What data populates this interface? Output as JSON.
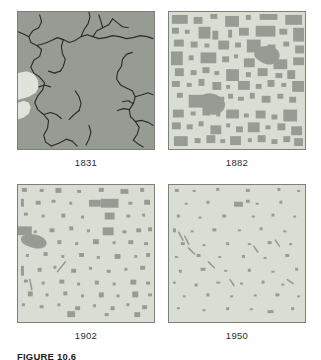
{
  "figure": {
    "caption": "FIGURE 10.6",
    "colors": {
      "forest": "#969b93",
      "cleared": "#d9ddd4",
      "prairie": "#dfe3da",
      "stream": "#2b2b2b",
      "frame_border": "#7d8279",
      "page_background": "#ffffff",
      "label_text": "#2b2b2b"
    }
  },
  "panels": [
    {
      "year": "1831",
      "position": "top-left",
      "background_class": "forest",
      "has_streams": true,
      "has_prairie": true,
      "forest_shapes": [],
      "prairie_shapes": [
        "M0,62 L9,60 L16,63 L20,69 L21,76 L18,82 L11,86 L4,88 L0,89 Z",
        "M0,92 L6,90 L11,92 L13,97 L11,103 L6,107 L0,109 Z"
      ],
      "streams": [
        "M22,3 L24,10 L21,16 L15,19 L11,25 L13,31 L19,34 L24,38 L22,45 L16,49 L13,56 L16,62 L22,66 L27,72 L25,79 L20,85 L17,92 L20,99 L26,104 L31,110 L30,118 L26,125 L28,132 L34,136",
        "M34,136 L42,133 L49,129 L55,131 L60,136",
        "M19,34 L27,32 L34,29 L40,26 L46,28 L52,31 L58,29 L64,25 L70,23 L76,25 L82,27 L89,26",
        "M89,26 L96,24 L103,25 L110,27 L117,26 L124,24 L131,25 L137,27",
        "M64,25 L67,18 L71,12 L73,5 L72,0",
        "M76,25 L80,19 L86,16 L92,13 L96,7",
        "M96,7 L101,11 L106,15 L112,16",
        "M86,16 L84,9 L82,3",
        "M46,28 L44,35 L45,42 L48,48 L46,55 L43,60",
        "M43,60 L37,62 L31,60",
        "M11,25 L5,22 L0,20",
        "M21,76 L27,74 L33,76",
        "M26,104 L33,102 L39,104 L44,108",
        "M105,55 L101,61 L100,68 L104,74 L110,77 L116,80 L119,86 L117,93 L113,99 L114,106 L119,111 L123,117 L121,124 L117,130",
        "M105,55 L106,48 L110,43 L116,41",
        "M119,86 L126,84 L132,82 L137,84",
        "M119,111 L126,110 L132,112 L137,115",
        "M113,99 L107,98 L101,100",
        "M117,130 L122,134 L127,137",
        "M117,93 L112,90 L106,91",
        "M58,80 L62,86 L64,93 L62,100",
        "M62,100 L57,104 L52,109",
        "M72,115 L74,122 L72,129 L69,135"
      ]
    },
    {
      "year": "1882",
      "position": "top-right",
      "background_class": "cleared",
      "has_streams": false,
      "has_prairie": false,
      "forest_shapes": [
        "M3,3 h16 v9 h-16 z",
        "M25,5 h9 v7 h-9 z",
        "M42,2 h7 v5 h-7 z",
        "M57,4 h14 v11 h-14 z",
        "M78,3 h5 v5 h-5 z",
        "M92,2 h18 v6 h-18 z",
        "M118,3 h17 v10 h-17 z",
        "M3,16 h7 v6 h-7 z",
        "M16,18 h5 v4 h-5 z",
        "M30,15 h12 v12 h-12 z",
        "M44,19 h6 v9 h-6 z",
        "M60,18 h4 v8 h-4 z",
        "M71,16 h10 v8 h-10 z",
        "M88,14 h20 v11 h-20 z",
        "M112,17 h8 v6 h-8 z",
        "M126,16 h11 v14 h-11 z",
        "M5,28 h10 v7 h-10 z",
        "M22,30 h7 v6 h-7 z",
        "M36,32 h5 v4 h-5 z",
        "M50,29 h11 v9 h-11 z",
        "M67,31 h6 v5 h-6 z",
        "M79,28 h14 v13 h-14 z",
        "M100,33 h8 v6 h-8 z",
        "M116,30 h6 v5 h-6 z",
        "M128,34 h9 v8 h-9 z",
        "M2,40 h12 v14 h-12 z",
        "M20,44 h5 v5 h-5 z",
        "M32,41 h16 v11 h-16 z",
        "M54,45 h7 v6 h-7 z",
        "M66,43 h4 v4 h-4 z",
        "M76,47 h11 v9 h-11 z",
        "M94,44 h6 v7 h-6 z",
        "M106,48 h14 v10 h-14 z",
        "M126,46 h11 v8 h-11 z",
        "M6,57 h9 v8 h-9 z",
        "M22,59 h6 v5 h-6 z",
        "M34,56 h7 v6 h-7 z",
        "M46,60 h5 v4 h-5 z",
        "M58,58 h13 v12 h-13 z",
        "M78,61 h5 v5 h-5 z",
        "M90,57 h10 v8 h-10 z",
        "M108,62 h7 v5 h-7 z",
        "M120,59 h8 v9 h-8 z",
        "M3,70 h8 v6 h-8 z",
        "M18,72 h5 v4 h-5 z",
        "M30,68 h6 v7 h-6 z",
        "M44,71 h9 v8 h-9 z",
        "M58,74 h4 v4 h-4 z",
        "M70,70 h12 v9 h-12 z",
        "M88,73 h6 v5 h-6 z",
        "M100,69 h7 v7 h-7 z",
        "M114,72 h5 v4 h-5 z",
        "M125,70 h12 v11 h-12 z",
        "M8,82 h6 v5 h-6 z",
        "M20,84 h18 v13 h-18 z",
        "M42,86 h14 v11 h-14 z",
        "M60,83 h5 v5 h-5 z",
        "M70,86 h6 v4 h-6 z",
        "M82,82 h5 v6 h-5 z",
        "M94,85 h9 v7 h-9 z",
        "M110,83 h6 v5 h-6 z",
        "M122,86 h7 v6 h-7 z",
        "M4,99 h11 v8 h-11 z",
        "M22,101 h5 v4 h-5 z",
        "M34,98 h8 v7 h-8 z",
        "M48,102 h4 v4 h-4 z",
        "M58,99 h13 v9 h-13 z",
        "M76,103 h5 v4 h-5 z",
        "M88,100 h10 v8 h-10 z",
        "M104,104 h6 v5 h-6 z",
        "M116,99 h14 v12 h-14 z",
        "M3,112 h9 v7 h-9 z",
        "M18,114 h6 v5 h-6 z",
        "M30,111 h5 v5 h-5 z",
        "M42,115 h11 v9 h-11 z",
        "M58,113 h4 v4 h-4 z",
        "M68,116 h7 v6 h-7 z",
        "M80,112 h12 v10 h-12 z",
        "M98,115 h5 v4 h-5 z",
        "M110,113 h8 v7 h-8 z",
        "M124,116 h11 v9 h-11 z",
        "M5,126 h14 v10 h-14 z",
        "M26,128 h6 v5 h-6 z",
        "M38,125 h9 v8 h-9 z",
        "M52,129 h5 v4 h-5 z",
        "M62,126 h11 v9 h-11 z",
        "M80,128 h4 v4 h-4 z",
        "M90,125 h8 v7 h-8 z",
        "M104,129 h6 v5 h-6 z",
        "M116,126 h7 v6 h-7 z",
        "M127,128 h9 v8 h-9 z",
        "M32,86 C38,80 48,82 54,88 C60,94 56,102 48,104 C40,106 30,98 32,86 Z",
        "M88,38 C96,32 110,34 112,42 C114,50 104,56 96,52 C88,48 84,44 88,38 Z"
      ],
      "prairie_shapes": [],
      "streams": []
    },
    {
      "year": "1902",
      "position": "bottom-left",
      "background_class": "cleared",
      "has_streams": false,
      "has_prairie": false,
      "forest_shapes": [
        "M4,3 h5 v4 h-5 z",
        "M22,4 h4 v3 h-4 z",
        "M38,3 h6 v5 h-6 z",
        "M60,5 h4 v3 h-4 z",
        "M82,3 h5 v4 h-5 z",
        "M104,4 h8 v5 h-8 z",
        "M124,3 h4 v4 h-4 z",
        "M3,14 h3 v8 h-3 z",
        "M18,16 h5 v4 h-5 z",
        "M34,15 h4 v3 h-4 z",
        "M52,17 h3 v3 h-3 z",
        "M72,15 h12 v7 h-12 z",
        "M84,14 h18 v9 h-18 z",
        "M112,17 h4 v3 h-4 z",
        "M128,15 h6 v5 h-6 z",
        "M6,28 h4 v3 h-4 z",
        "M24,30 h3 v3 h-3 z",
        "M44,29 h4 v4 h-4 z",
        "M64,31 h3 v3 h-3 z",
        "M88,28 h10 v7 h-10 z",
        "M110,30 h4 v3 h-4 z",
        "M126,29 h3 v3 h-3 z",
        "M0,42 h14 v9 h-14 z",
        "M16,46 h3 v3 h-3 z",
        "M32,44 h5 v4 h-5 z",
        "M52,42 h4 v4 h-4 z",
        "M70,45 h3 v3 h-3 z",
        "M86,43 h11 v8 h-11 z",
        "M106,46 h4 v3 h-4 z",
        "M120,44 h5 v4 h-5 z",
        "M132,43 h4 v4 h-4 z",
        "M4,52 C12,48 24,50 28,56 C32,62 24,66 16,64 C8,62 0,58 4,52 Z",
        "M20,58 h6 v4 h-6 z",
        "M40,56 h4 v4 h-4 z",
        "M58,58 h3 v3 h-3 z",
        "M76,55 h6 v5 h-6 z",
        "M96,57 h3 v3 h-3 z",
        "M112,56 h5 v4 h-5 z",
        "M128,58 h4 v3 h-4 z",
        "M8,70 h3 v3 h-3 z",
        "M26,68 h4 v4 h-4 z",
        "M44,71 h3 v3 h-3 z",
        "M62,69 h5 v4 h-5 z",
        "M80,72 h3 v3 h-3 z",
        "M98,70 h6 v5 h-6 z",
        "M118,71 h3 v3 h-3 z",
        "M130,69 h4 v4 h-4 z",
        "M3,82 h3 v10 h-3 z",
        "M20,84 h4 v4 h-4 z",
        "M36,82 h3 v3 h-3 z",
        "M54,85 h5 v4 h-5 z",
        "M72,83 h3 v3 h-3 z",
        "M90,86 h4 v3 h-4 z",
        "M108,84 h3 v3 h-3 z",
        "M124,82 h5 v4 h-5 z",
        "M6,96 h4 v3 h-4 z",
        "M24,98 h3 v3 h-3 z",
        "M42,96 h5 v4 h-5 z",
        "M60,99 h3 v3 h-3 z",
        "M78,97 h4 v4 h-4 z",
        "M96,99 h3 v3 h-3 z",
        "M114,96 h6 v5 h-6 z",
        "M130,98 h4 v3 h-4 z",
        "M10,108 h5 v5 h-5 z",
        "M28,110 h3 v3 h-3 z",
        "M46,108 h4 v4 h-4 z",
        "M64,111 h3 v3 h-3 z",
        "M82,109 h5 v5 h-5 z",
        "M100,111 h3 v3 h-3 z",
        "M116,108 h6 v6 h-6 z",
        "M132,110 h4 v3 h-4 z",
        "M4,120 h3 v3 h-3 z",
        "M22,122 h4 v3 h-4 z",
        "M40,120 h3 v3 h-3 z",
        "M58,123 h5 v4 h-5 z",
        "M76,121 h3 v3 h-3 z",
        "M94,123 h4 v4 h-4 z",
        "M110,120 h3 v3 h-3 z",
        "M126,122 h5 v4 h-5 z",
        "M50,128 h8 v6 h-8 z",
        "M88,130 h4 v3 h-4 z",
        "M118,129 h6 v5 h-6 z",
        "M40,88 L48,78",
        "M12,96 L14,106"
      ],
      "prairie_shapes": [],
      "streams": []
    },
    {
      "year": "1950",
      "position": "bottom-right",
      "background_class": "cleared",
      "has_streams": false,
      "has_prairie": false,
      "forest_shapes": [
        "M6,4 h4 v3 h-4 z",
        "M24,5 h3 v2 h-3 z",
        "M48,3 h3 v3 h-3 z",
        "M78,4 h4 v3 h-4 z",
        "M110,3 h3 v3 h-3 z",
        "M130,5 h3 v2 h-3 z",
        "M16,18 h3 v2 h-3 z",
        "M38,16 h3 v3 h-3 z",
        "M66,17 h9 v5 h-9 z",
        "M78,15 h4 v3 h-4 z",
        "M88,18 h3 v2 h-3 z",
        "M112,16 h3 v3 h-3 z",
        "M8,30 h3 v3 h-3 z",
        "M30,32 h3 v2 h-3 z",
        "M54,30 h4 v3 h-4 z",
        "M84,31 h3 v2 h-3 z",
        "M104,29 h3 v3 h-3 z",
        "M126,31 h3 v2 h-3 z",
        "M4,44 h3 v4 h-3 z",
        "M22,46 h3 v2 h-3 z",
        "M44,44 h4 v3 h-4 z",
        "M70,45 h3 v2 h-3 z",
        "M92,43 h3 v3 h-3 z",
        "M116,46 h3 v2 h-3 z",
        "M12,58 h4 v3 h-4 z",
        "M34,60 h3 v2 h-3 z",
        "M58,58 h3 v3 h-3 z",
        "M80,59 h3 v2 h-3 z",
        "M100,57 h4 v3 h-4 z",
        "M122,59 h3 v2 h-3 z",
        "M6,72 h3 v2 h-3 z",
        "M28,70 h4 v3 h-4 z",
        "M50,72 h3 v2 h-3 z",
        "M74,71 h3 v3 h-3 z",
        "M96,73 h3 v2 h-3 z",
        "M118,70 h4 v3 h-4 z",
        "M10,86 h3 v3 h-3 z",
        "M32,84 h5 v3 h-5 z",
        "M56,86 h3 v2 h-3 z",
        "M80,85 h3 v3 h-3 z",
        "M104,87 h3 v2 h-3 z",
        "M128,84 h3 v3 h-3 z",
        "M4,98 h3 v2 h-3 z",
        "M26,100 h3 v3 h-3 z",
        "M48,98 h4 v2 h-4 z",
        "M72,99 h3 v2 h-3 z",
        "M94,97 h3 v3 h-3 z",
        "M114,100 h3 v2 h-3 z",
        "M14,112 h3 v2 h-3 z",
        "M38,110 h3 v3 h-3 z",
        "M62,112 h3 v2 h-3 z",
        "M86,111 h3 v2 h-3 z",
        "M108,110 h4 v3 h-4 z",
        "M130,112 h3 v2 h-3 z",
        "M8,124 h3 v2 h-3 z",
        "M34,126 h3 v2 h-3 z",
        "M58,124 h3 v3 h-3 z",
        "M82,125 h3 v2 h-3 z",
        "M100,127 h6 v3 h-6 z",
        "M124,124 h3 v3 h-3 z",
        "M10,48 L14,56",
        "M16,52 L20,60",
        "M20,64 L26,70",
        "M40,78 L46,84",
        "M62,96 L66,102",
        "M86,62 L90,68",
        "M108,56 L112,62",
        "M120,96 L126,100"
      ],
      "prairie_shapes": [],
      "streams": []
    }
  ]
}
